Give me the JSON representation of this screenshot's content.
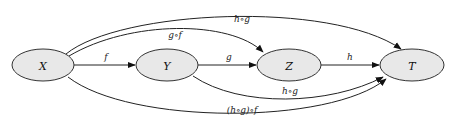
{
  "diagram": {
    "type": "commutative-diagram",
    "nodes": [
      {
        "id": "X",
        "label": "X",
        "cx": 43,
        "cy": 65,
        "rx": 31,
        "ry": 16
      },
      {
        "id": "Y",
        "label": "Y",
        "cx": 167,
        "cy": 65,
        "rx": 31,
        "ry": 16
      },
      {
        "id": "Z",
        "label": "Z",
        "cx": 289,
        "cy": 65,
        "rx": 32,
        "ry": 16
      },
      {
        "id": "T",
        "label": "T",
        "cx": 412,
        "cy": 65,
        "rx": 32,
        "ry": 16
      }
    ],
    "edges": [
      {
        "id": "f",
        "from": "X",
        "to": "Y",
        "label": "f"
      },
      {
        "id": "g",
        "from": "Y",
        "to": "Z",
        "label": "g"
      },
      {
        "id": "h",
        "from": "Z",
        "to": "T",
        "label": "h"
      },
      {
        "id": "g_f",
        "from": "X",
        "to": "Z",
        "label": "g∘f"
      },
      {
        "id": "h_g",
        "from": "Y",
        "to": "T",
        "label": "h∘g"
      },
      {
        "id": "h_gf",
        "from": "X",
        "to": "T",
        "label": "h∘(g∘f)"
      },
      {
        "id": "hg_f",
        "from": "X",
        "to": "T",
        "label": "(h∘g)∘f"
      }
    ],
    "colors": {
      "node_fill": "#e8e8e8",
      "node_stroke": "#333333",
      "edge": "#222222",
      "background": "#ffffff"
    }
  }
}
